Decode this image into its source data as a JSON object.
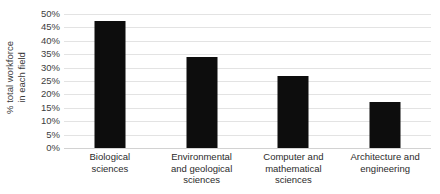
{
  "chart_data": {
    "type": "bar",
    "title": "",
    "xlabel": "",
    "ylabel": "% total workforce in each field",
    "ylabel_lines": [
      "% total workforce",
      "in each field"
    ],
    "categories": [
      "Biological sciences",
      "Environmental and geological sciences",
      "Computer and mathematical sciences",
      "Architecture and engineering"
    ],
    "category_lines": [
      [
        "Biological",
        "sciences"
      ],
      [
        "Environmental",
        "and geological",
        "sciences"
      ],
      [
        "Computer and",
        "mathematical",
        "sciences"
      ],
      [
        "Architecture and",
        "engineering"
      ]
    ],
    "values": [
      47.5,
      34,
      27,
      17
    ],
    "value_labels": [
      "47.5%",
      "34%",
      "27%",
      "17%"
    ],
    "ylim": [
      0,
      50
    ],
    "ytick_step": 5,
    "ytick_labels": [
      "50%",
      "45%",
      "40%",
      "35%",
      "30%",
      "25%",
      "20%",
      "15%",
      "10%",
      "5%",
      "0%"
    ],
    "ytick_values": [
      50,
      45,
      40,
      35,
      30,
      25,
      20,
      15,
      10,
      5,
      0
    ],
    "grid": true,
    "legend": false,
    "legend_position": "none",
    "bar_color": "#0d0d0d",
    "gridline_color": "#e3e3e3",
    "background_color": "#ffffff",
    "axis_text_color": "#404040"
  }
}
